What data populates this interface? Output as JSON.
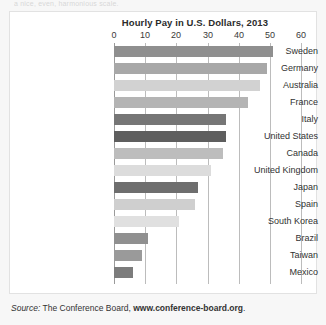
{
  "top_cut_text": "a nice, even, harmonious scale.",
  "source": {
    "prefix": "Source:",
    "org": "The Conference Board,",
    "url": "www.conference-board.org",
    "period": "."
  },
  "chart_data": {
    "type": "bar",
    "orientation": "horizontal",
    "title": "Hourly Pay in U.S. Dollars, 2013",
    "xlabel": "",
    "ylabel": "",
    "xlim": [
      0,
      60
    ],
    "xticks": [
      0,
      10,
      20,
      30,
      40,
      50,
      60
    ],
    "xtick_labels": [
      "0",
      "10",
      "20",
      "30",
      "40",
      "50",
      "60"
    ],
    "grid": true,
    "legend": false,
    "categories": [
      "Sweden",
      "Germany",
      "Australia",
      "France",
      "Italy",
      "United States",
      "Canada",
      "United Kingdom",
      "Japan",
      "Spain",
      "South Korea",
      "Brazil",
      "Taiwan",
      "Mexico"
    ],
    "values": [
      51,
      49,
      47,
      43,
      36,
      36,
      35,
      31,
      27,
      26,
      21,
      11,
      9,
      6
    ],
    "bar_colors": [
      "#8f8f8f",
      "#a8a8a8",
      "#d2d2d2",
      "#b4b4b4",
      "#767676",
      "#5e5e5e",
      "#bdbdbd",
      "#dcdcdc",
      "#6e6e6e",
      "#cfcfcf",
      "#e0e0e0",
      "#909090",
      "#9a9a9a",
      "#7c7c7c"
    ],
    "colors": {
      "background": "#ffffff",
      "page_background": "#f7f7f7",
      "gridline": "#bcbcbc",
      "axis": "#9a9a9a",
      "text": "#323232"
    }
  }
}
